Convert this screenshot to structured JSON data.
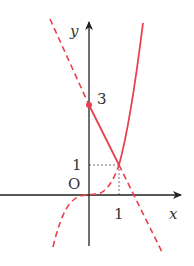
{
  "figure": {
    "axes": {
      "x_label": "x",
      "y_label": "y",
      "origin_label": "O",
      "x_tick_label": "1",
      "y_tick_labels": [
        "1",
        "3"
      ]
    },
    "colors": {
      "curve": "#e8404f",
      "axis": "#222222",
      "guide": "#444444"
    },
    "curves": [
      {
        "name": "line",
        "equation": "y = -2x + 3",
        "solid_range": [
          0,
          1
        ],
        "dashed_ranges": [
          [
            -1.5,
            0
          ],
          [
            1,
            2.5
          ]
        ]
      },
      {
        "name": "cubic",
        "equation": "y = x^3",
        "solid_range": [
          1,
          1.8
        ],
        "dashed_range": [
          -1.2,
          1
        ]
      }
    ],
    "points": [
      {
        "label": "3",
        "x": 0,
        "y": 3,
        "marked": true
      },
      {
        "label": "(1, 1)",
        "x": 1,
        "y": 1,
        "marked": false
      }
    ]
  }
}
